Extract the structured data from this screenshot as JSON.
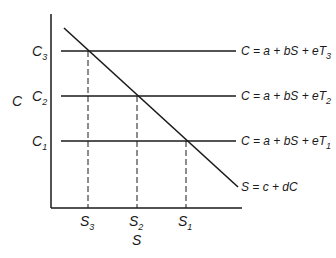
{
  "diagram": {
    "y_axis_label": "C",
    "x_axis_label": "S",
    "y_ticks": [
      {
        "base": "C",
        "sub": "3"
      },
      {
        "base": "C",
        "sub": "2"
      },
      {
        "base": "C",
        "sub": "1"
      }
    ],
    "x_ticks": [
      {
        "base": "S",
        "sub": "3"
      },
      {
        "base": "S",
        "sub": "2"
      },
      {
        "base": "S",
        "sub": "1"
      }
    ],
    "horizontal_lines": [
      {
        "equation": "C = a + bS + eT",
        "sub": "3"
      },
      {
        "equation": "C = a + bS + eT",
        "sub": "2"
      },
      {
        "equation": "C = a + bS + eT",
        "sub": "1"
      }
    ],
    "diagonal_line": {
      "equation": "S = c + dC"
    },
    "colors": {
      "ink": "#1a1a1a",
      "background": "#ffffff"
    }
  }
}
